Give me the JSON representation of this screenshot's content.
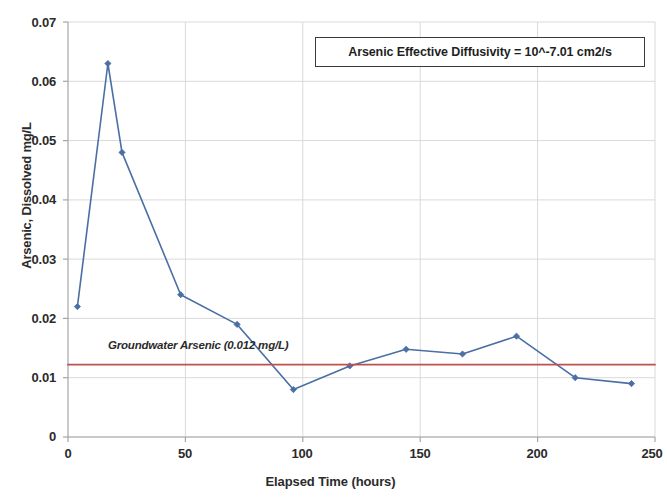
{
  "chart_data": {
    "type": "line",
    "title": "",
    "xlabel": "Elapsed Time (hours)",
    "ylabel": "Arsenic, Dissolved mg/L",
    "xlim": [
      0,
      250
    ],
    "ylim": [
      0,
      0.07
    ],
    "xticks": [
      "0",
      "50",
      "100",
      "150",
      "200",
      "250"
    ],
    "xtick_values": [
      0,
      50,
      100,
      150,
      200,
      250
    ],
    "yticks": [
      "0",
      "0.01",
      "0.02",
      "0.03",
      "0.04",
      "0.05",
      "0.06",
      "0.07"
    ],
    "ytick_values": [
      0,
      0.01,
      0.02,
      0.03,
      0.04,
      0.05,
      0.06,
      0.07
    ],
    "grid": true,
    "legend": "none",
    "series": [
      {
        "name": "Arsenic, Dissolved",
        "color": "#4a6fa5",
        "marker": "diamond",
        "x": [
          4,
          17,
          23,
          48,
          72,
          96,
          120,
          144,
          168,
          191,
          216,
          240
        ],
        "values": [
          0.022,
          0.063,
          0.048,
          0.024,
          0.019,
          0.008,
          0.012,
          0.0148,
          0.014,
          0.017,
          0.01,
          0.009
        ]
      },
      {
        "name": "Groundwater Arsenic",
        "color": "#c0504d",
        "marker": "none",
        "x": [
          0,
          250
        ],
        "values": [
          0.0122,
          0.0122
        ]
      }
    ],
    "annotations": [
      {
        "name": "diffusivity-box",
        "text": "Arsenic Effective Diffusivity = 10^-7.01 cm2/s"
      },
      {
        "name": "groundwater-arsenic-label",
        "text": "Groundwater Arsenic (0.012 mg/L)"
      }
    ]
  },
  "axes": {
    "y_title": "Arsenic, Dissolved mg/L",
    "x_title": "Elapsed Time (hours)"
  },
  "annotation_box": {
    "text": "Arsenic Effective Diffusivity = 10^-7.01 cm2/s"
  },
  "groundwater_label": {
    "text": "Groundwater Arsenic (0.012 mg/L)"
  },
  "ytick_labels": [
    "0.07",
    "0.06",
    "0.05",
    "0.04",
    "0.03",
    "0.02",
    "0.01",
    "0"
  ],
  "xtick_labels": [
    "0",
    "50",
    "100",
    "150",
    "200",
    "250"
  ],
  "colors": {
    "series_line": "#4a6fa5",
    "threshold_line": "#c0504d",
    "grid": "#d9d9d9",
    "axis": "#a6a6a6",
    "text": "#2b2b2b"
  }
}
